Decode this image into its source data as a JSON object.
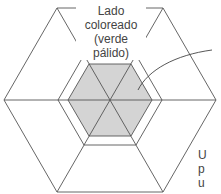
{
  "diagram": {
    "title_lines": [
      "Lado",
      "coloreado",
      "(verde pálido)"
    ],
    "side_label_lines": [
      "U",
      "p",
      "u"
    ],
    "colors": {
      "line": "#555555",
      "shaded_fill": "#d4d4d4",
      "text": "#444444"
    },
    "shapes": {
      "outer_hexagon": "outer hexagon divided into 6 triangles by three diagonals",
      "inner_outline_hexagon": "unfilled hexagon ring around shaded hexagon",
      "shaded_hexagon": "central shaded hexagon (colored side)",
      "arrow": "curved leader line pointing to shaded region"
    }
  }
}
